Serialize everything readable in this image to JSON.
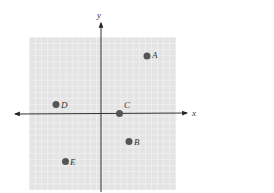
{
  "diagram": {
    "type": "coordinate-plane",
    "axes": {
      "x_label": "x",
      "y_label": "y"
    },
    "colors": {
      "grid_background": "#e6e6e6",
      "grid_line": "#f7f7f7",
      "axis": "#333333",
      "point": "#555555",
      "label": "#333333"
    },
    "points": [
      {
        "label": "A",
        "quadrant": "I"
      },
      {
        "label": "B",
        "quadrant": "IV"
      },
      {
        "label": "C",
        "quadrant": "on positive x-axis"
      },
      {
        "label": "D",
        "quadrant": "II"
      },
      {
        "label": "E",
        "quadrant": "III"
      }
    ]
  }
}
